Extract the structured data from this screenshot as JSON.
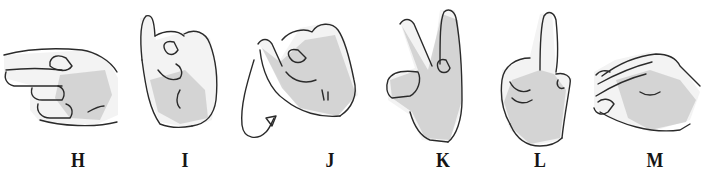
{
  "figure": {
    "type": "manual alphabet illustration",
    "signs": [
      {
        "letter": "H",
        "description": "hand horizontal, index and middle fingers extended sideways",
        "label_x": 78
      },
      {
        "letter": "I",
        "description": "fist with little finger raised",
        "label_x": 185
      },
      {
        "letter": "J",
        "description": "little finger raised with curved motion arrow",
        "label_x": 330,
        "motion_arrow": true
      },
      {
        "letter": "K",
        "description": "index and middle fingers raised in V, thumb between",
        "label_x": 443
      },
      {
        "letter": "L",
        "description": "index finger raised, thumb extended",
        "label_x": 540
      },
      {
        "letter": "M",
        "description": "hand pointing down with three fingers over thumb",
        "label_x": 655
      }
    ],
    "caption_partial": "H I J K L M"
  },
  "colors": {
    "background": "#ffffff",
    "ink": "#2a2a2a",
    "shading": "#c9c9c9"
  }
}
